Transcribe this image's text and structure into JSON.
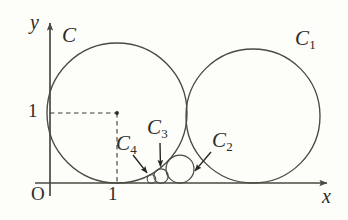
{
  "figure": {
    "kind": "geometry-diagram",
    "background_color": "#fdfdfa",
    "ink_color": "#4a4a42",
    "text_color": "#2b2b28"
  },
  "axes": {
    "x_axis_label": "x",
    "y_axis_label": "y",
    "origin_label": "O",
    "x_tick_label": "1",
    "y_tick_label": "1",
    "x_axis": {
      "y": 183,
      "x_start": 35,
      "x_end": 330
    },
    "y_axis": {
      "x": 50,
      "y_start": 196,
      "y_end": 20
    },
    "x_tick_value": 1,
    "y_tick_value": 1,
    "unit_pixels": 67
  },
  "guides": {
    "dashed": true,
    "horizontal": {
      "x1": 50,
      "y1": 113,
      "x2": 117,
      "y2": 113
    },
    "vertical": {
      "x1": 117,
      "y1": 113,
      "x2": 117,
      "y2": 183
    },
    "center_dot": {
      "x": 117,
      "y": 113
    }
  },
  "circles": [
    {
      "id": "C",
      "label": "C",
      "sub": "",
      "cx": 117,
      "cy": 113,
      "r": 70
    },
    {
      "id": "C1",
      "label": "C",
      "sub": "1",
      "cx": 253,
      "cy": 116,
      "r": 67
    },
    {
      "id": "C2",
      "label": "C",
      "sub": "2",
      "cx": 180,
      "cy": 169,
      "r": 14
    },
    {
      "id": "C3",
      "label": "C",
      "sub": "3",
      "cx": 161,
      "cy": 176,
      "r": 7.2
    },
    {
      "id": "C4",
      "label": "C",
      "sub": "4",
      "cx": 151.5,
      "cy": 179,
      "r": 4.3
    }
  ],
  "labels": {
    "C": {
      "text": "C",
      "sub": "",
      "x": 62,
      "y": 30
    },
    "C1": {
      "text": "C",
      "sub": "1",
      "x": 295,
      "y": 32
    },
    "C2": {
      "text": "C",
      "sub": "2",
      "x": 212,
      "y": 134
    },
    "C3": {
      "text": "C",
      "sub": "3",
      "x": 147,
      "y": 120
    },
    "C4": {
      "text": "C",
      "sub": "4",
      "x": 116,
      "y": 136
    },
    "y": {
      "text": "y",
      "x": 30,
      "y": 18
    },
    "x": {
      "text": "x",
      "x": 322,
      "y": 190
    },
    "O": {
      "text": "O",
      "x": 31,
      "y": 186
    },
    "one_x": {
      "text": "1",
      "x": 108,
      "y": 186
    },
    "one_y": {
      "text": "1",
      "x": 28,
      "y": 101
    }
  },
  "arrows": [
    {
      "name": "arrow-to-c3",
      "x1": 160,
      "y1": 143,
      "x2": 160.5,
      "y2": 168
    },
    {
      "name": "arrow-to-c4",
      "x1": 133,
      "y1": 155,
      "x2": 148,
      "y2": 174
    },
    {
      "name": "arrow-to-c2",
      "x1": 211,
      "y1": 152,
      "x2": 194,
      "y2": 172
    }
  ]
}
